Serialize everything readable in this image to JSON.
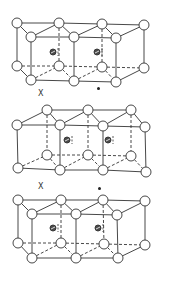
{
  "figure": {
    "colors": {
      "line": "#333333",
      "atom_fill": "#ffffff",
      "inner_atom_fill": "#4a4a4a"
    },
    "atom_radius": 5,
    "inner_atom_radius": 3,
    "blocks": [
      {
        "name": "unit-cell-top",
        "type": "back4",
        "back_top": [
          [
            17,
            23
          ],
          [
            59,
            23
          ],
          [
            102,
            24
          ],
          [
            144,
            25
          ]
        ],
        "front_top": [
          [
            31,
            37
          ],
          [
            74,
            37
          ],
          [
            116,
            38
          ]
        ],
        "back_bottom": [
          [
            17,
            66
          ],
          [
            59,
            66
          ],
          [
            102,
            67
          ],
          [
            144,
            68
          ]
        ],
        "front_bottom": [
          [
            31,
            80
          ],
          [
            74,
            81
          ],
          [
            116,
            82
          ]
        ],
        "inner": [
          [
            53,
            52
          ],
          [
            97,
            52
          ]
        ]
      },
      {
        "name": "unit-cell-middle",
        "type": "front4",
        "back_top": [
          [
            47,
            110
          ],
          [
            88,
            110
          ],
          [
            131,
            110
          ]
        ],
        "front_top": [
          [
            17,
            125
          ],
          [
            60,
            125
          ],
          [
            103,
            126
          ],
          [
            145,
            127
          ]
        ],
        "back_bottom": [
          [
            47,
            155
          ],
          [
            88,
            155
          ],
          [
            131,
            156
          ]
        ],
        "front_bottom": [
          [
            18,
            168
          ],
          [
            60,
            170
          ],
          [
            103,
            170
          ],
          [
            146,
            172
          ]
        ],
        "inner": [
          [
            67,
            140
          ],
          [
            108,
            140
          ]
        ]
      },
      {
        "name": "unit-cell-bottom",
        "type": "back4",
        "back_top": [
          [
            18,
            200
          ],
          [
            61,
            200
          ],
          [
            103,
            200
          ],
          [
            145,
            201
          ]
        ],
        "front_top": [
          [
            32,
            214
          ],
          [
            76,
            214
          ],
          [
            117,
            215
          ]
        ],
        "back_bottom": [
          [
            18,
            243
          ],
          [
            61,
            243
          ],
          [
            104,
            244
          ],
          [
            145,
            245
          ]
        ],
        "front_bottom": [
          [
            32,
            258
          ],
          [
            76,
            258
          ],
          [
            118,
            258
          ]
        ],
        "inner": [
          [
            53,
            228
          ],
          [
            98,
            228
          ]
        ]
      }
    ],
    "markers": [
      {
        "name": "x-marker-1",
        "text": "X",
        "x": 38,
        "y": 90
      },
      {
        "name": "x-marker-2",
        "text": "X",
        "x": 38,
        "y": 183
      }
    ],
    "dots": [
      {
        "name": "dot-marker-1",
        "x": 98,
        "y": 88
      },
      {
        "name": "dot-marker-2",
        "x": 99,
        "y": 188
      }
    ]
  }
}
